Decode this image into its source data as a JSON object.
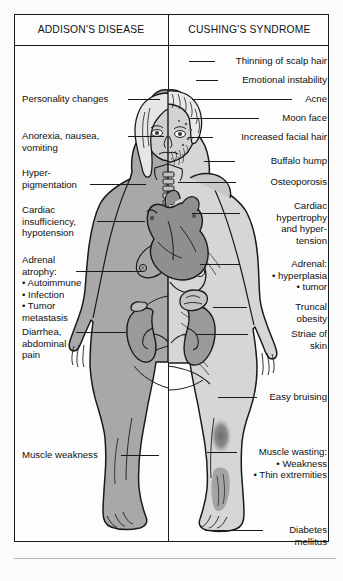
{
  "diagram": {
    "title_left": "ADDISON'S DISEASE",
    "title_right": "CUSHING'S SYNDROME",
    "figure_name": "split-body-endocrine-comparison",
    "colors": {
      "ink": "#1a1a1a",
      "skin_left": "#a8a8a8",
      "skin_right": "#d6d6d6",
      "organ_heart": "#8f8f8f",
      "organ_kidney": "#9a9a9a",
      "bruise": "#7d7d7d",
      "page": "#fdfdfd"
    }
  },
  "left_labels": [
    {
      "text": "Personality changes",
      "line": "leader-personality-changes"
    },
    {
      "text": "Anorexia, nausea,\nvomiting",
      "line": "leader-anorexia"
    },
    {
      "text": "Hyper-\npigmentation",
      "line": "leader-hyperpigmentation"
    },
    {
      "text": "Cardiac\ninsufficiency,\nhypotension",
      "line": "leader-cardiac-insufficiency"
    },
    {
      "text": "Adrenal\natrophy:\n• Autoimmune\n• Infection\n• Tumor\n  metastasis",
      "line": "leader-adrenal-atrophy"
    },
    {
      "text": "Diarrhea,\nabdominal\npain",
      "line": "leader-diarrhea"
    },
    {
      "text": "Muscle weakness",
      "line": "leader-muscle-weakness"
    }
  ],
  "right_labels": [
    {
      "text": "Thinning of scalp hair",
      "line": "leader-thinning-scalp-hair"
    },
    {
      "text": "Emotional instability",
      "line": "leader-emotional-instability"
    },
    {
      "text": "Acne",
      "line": "leader-acne"
    },
    {
      "text": "Moon face",
      "line": "leader-moon-face"
    },
    {
      "text": "Increased facial hair",
      "line": "leader-increased-facial-hair"
    },
    {
      "text": "Buffalo hump",
      "line": "leader-buffalo-hump"
    },
    {
      "text": "Osteoporosis",
      "line": "leader-osteoporosis"
    },
    {
      "text": "Cardiac\nhypertrophy\nand hyper-\ntension",
      "line": "leader-cardiac-hypertrophy"
    },
    {
      "text": "Adrenal:\n• hyperplasia\n• tumor",
      "line": "leader-adrenal-hyperplasia"
    },
    {
      "text": "Truncal\nobesity",
      "line": "leader-truncal-obesity"
    },
    {
      "text": "Striae of\nskin",
      "line": "leader-striae"
    },
    {
      "text": "Easy bruising",
      "line": "leader-easy-bruising"
    },
    {
      "text": "Muscle wasting:\n• Weakness\n• Thin extremities",
      "line": "leader-muscle-wasting"
    },
    {
      "text": "Diabetes\nmellitus",
      "line": "leader-diabetes-mellitus"
    }
  ]
}
